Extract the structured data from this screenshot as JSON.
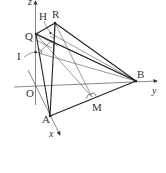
{
  "diagram": {
    "type": "3d-coordinate-geometry",
    "axes": {
      "x": {
        "label": "x"
      },
      "y": {
        "label": "y"
      },
      "z": {
        "label": "z"
      },
      "origin": {
        "label": "O"
      }
    },
    "points": {
      "O": {
        "label": "O"
      },
      "A": {
        "label": "A"
      },
      "B": {
        "label": "B"
      },
      "Q": {
        "label": "Q"
      },
      "R": {
        "label": "R"
      },
      "H": {
        "label": "H"
      },
      "I": {
        "label": "I"
      },
      "M": {
        "label": "M"
      }
    },
    "segments": [
      "QR",
      "RB",
      "QB",
      "QA",
      "RA",
      "AB",
      "QM",
      "RM",
      "IB",
      "HB",
      "QH"
    ],
    "right_angle_marks": [
      "M",
      "H",
      "I"
    ],
    "colors": {
      "stroke": "#333333",
      "background": "#ffffff"
    }
  }
}
